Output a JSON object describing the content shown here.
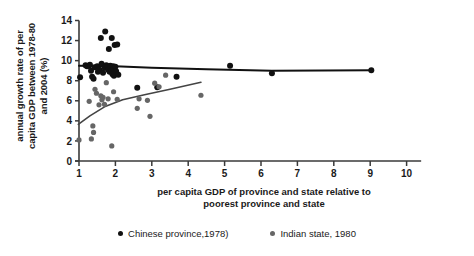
{
  "chart_data": {
    "type": "scatter",
    "title": "",
    "xlabel": "per capita GDP of province and state relative to poorest province and state",
    "ylabel": "annual growth rate of per capita GDP between 1978-80 and 2004 (%)",
    "xlim": [
      0.6,
      10.4
    ],
    "ylim": [
      0,
      14
    ],
    "xticks": [
      1,
      2,
      3,
      4,
      5,
      6,
      7,
      8,
      9,
      10
    ],
    "yticks": [
      0,
      2,
      4,
      6,
      8,
      10,
      12,
      14
    ],
    "grid": false,
    "legend_position": "bottom",
    "colors": {
      "china": "#111111",
      "india": "#666666",
      "axis": "#3a3a3a",
      "text": "#1a1a1a"
    },
    "series": [
      {
        "name": "Chinese province,1978)",
        "marker_color": "#111111",
        "points": [
          [
            1.03,
            8.35
          ],
          [
            1.18,
            9.55
          ],
          [
            1.22,
            9.45
          ],
          [
            1.27,
            9.5
          ],
          [
            1.3,
            9.6
          ],
          [
            1.33,
            9.0
          ],
          [
            1.36,
            8.4
          ],
          [
            1.4,
            8.2
          ],
          [
            1.43,
            9.35
          ],
          [
            1.5,
            9.45
          ],
          [
            1.52,
            8.9
          ],
          [
            1.56,
            9.1
          ],
          [
            1.6,
            12.25
          ],
          [
            1.62,
            9.7
          ],
          [
            1.66,
            8.8
          ],
          [
            1.7,
            9.3
          ],
          [
            1.72,
            12.9
          ],
          [
            1.75,
            9.55
          ],
          [
            1.78,
            9.45
          ],
          [
            1.8,
            9.1
          ],
          [
            1.82,
            11.15
          ],
          [
            1.84,
            8.9
          ],
          [
            1.86,
            9.5
          ],
          [
            1.88,
            9.3
          ],
          [
            1.9,
            9.05
          ],
          [
            1.9,
            12.25
          ],
          [
            1.92,
            8.65
          ],
          [
            1.94,
            9.45
          ],
          [
            1.95,
            9.2
          ],
          [
            1.96,
            8.5
          ],
          [
            1.98,
            11.55
          ],
          [
            2.0,
            9.4
          ],
          [
            2.02,
            8.95
          ],
          [
            2.05,
            11.6
          ],
          [
            2.08,
            8.6
          ],
          [
            2.6,
            7.3
          ],
          [
            3.15,
            7.35
          ],
          [
            3.68,
            8.4
          ],
          [
            5.15,
            9.5
          ],
          [
            6.3,
            8.75
          ],
          [
            9.03,
            9.05
          ]
        ]
      },
      {
        "name": "Indian state, 1980",
        "marker_color": "#666666",
        "points": [
          [
            1.0,
            2.1
          ],
          [
            1.28,
            5.95
          ],
          [
            1.34,
            2.2
          ],
          [
            1.38,
            3.5
          ],
          [
            1.4,
            2.85
          ],
          [
            1.44,
            7.15
          ],
          [
            1.48,
            6.75
          ],
          [
            1.55,
            5.6
          ],
          [
            1.6,
            6.5
          ],
          [
            1.63,
            6.1
          ],
          [
            1.66,
            6.35
          ],
          [
            1.7,
            5.65
          ],
          [
            1.75,
            7.8
          ],
          [
            1.8,
            6.2
          ],
          [
            1.9,
            1.5
          ],
          [
            1.95,
            6.9
          ],
          [
            2.05,
            6.15
          ],
          [
            2.6,
            5.25
          ],
          [
            2.65,
            6.2
          ],
          [
            2.88,
            6.05
          ],
          [
            2.95,
            4.45
          ],
          [
            3.08,
            7.75
          ],
          [
            3.2,
            7.4
          ],
          [
            3.38,
            8.55
          ],
          [
            4.35,
            6.55
          ]
        ]
      }
    ],
    "trendlines": [
      {
        "name": "china-trend",
        "color": "#111111",
        "points": [
          [
            1.0,
            9.5
          ],
          [
            2.0,
            9.45
          ],
          [
            3.0,
            9.3
          ],
          [
            4.5,
            9.15
          ],
          [
            6.3,
            9.0
          ],
          [
            9.05,
            9.05
          ]
        ]
      },
      {
        "name": "india-trend",
        "color": "#444444",
        "points": [
          [
            0.98,
            3.65
          ],
          [
            1.3,
            4.5
          ],
          [
            1.7,
            5.4
          ],
          [
            2.2,
            6.1
          ],
          [
            2.8,
            6.6
          ],
          [
            3.5,
            7.15
          ],
          [
            4.35,
            7.85
          ]
        ]
      }
    ]
  },
  "legend": {
    "items": [
      {
        "label": "Chinese province,1978)",
        "color": "#111111"
      },
      {
        "label": "Indian state, 1980",
        "color": "#666666"
      }
    ]
  },
  "axes": {
    "ylabel_line1": "annual growth rate of per",
    "ylabel_line2": "capita GDP between 1978-80",
    "ylabel_line3": "and 2004 (%)",
    "xlabel_line1": "per capita GDP of province and state relative to",
    "xlabel_line2": "poorest province and state"
  }
}
